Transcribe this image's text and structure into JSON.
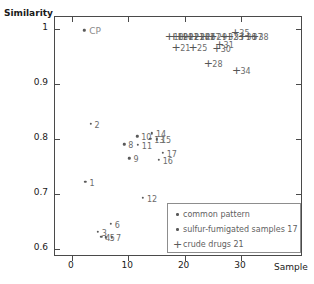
{
  "chart_data": {
    "type": "scatter",
    "title": "",
    "xlabel": "Sample",
    "ylabel": "Similarity",
    "xlim": [
      -3,
      41
    ],
    "ylim": [
      0.585,
      1.022
    ],
    "xticks": [
      "0",
      "10",
      "20",
      "30"
    ],
    "xtick_values": [
      0,
      10,
      20,
      30
    ],
    "yticks": [
      "0.6",
      "0.7",
      "0.8",
      "0.9",
      "1"
    ],
    "ytick_values": [
      0.6,
      0.7,
      0.8,
      0.9,
      1.0
    ],
    "grid": false,
    "legend_position": "bottom-right",
    "series": [
      {
        "name": "common pattern",
        "marker": "dot",
        "color": "#5a5a5a",
        "points": [
          {
            "label": "CP",
            "x": 2.2,
            "y": 0.998
          }
        ]
      },
      {
        "name": "sulfur-fumigated samples 1-17",
        "marker": "dot",
        "color": "#5a5a5a",
        "points": [
          {
            "label": "1",
            "x": 2.4,
            "y": 0.722
          },
          {
            "label": "2",
            "x": 3.3,
            "y": 0.828
          },
          {
            "label": "3",
            "x": 4.6,
            "y": 0.631
          },
          {
            "label": "4",
            "x": 5.2,
            "y": 0.622
          },
          {
            "label": "5",
            "x": 6.0,
            "y": 0.621
          },
          {
            "label": "6",
            "x": 6.9,
            "y": 0.645
          },
          {
            "label": "7",
            "x": 7.1,
            "y": 0.621
          },
          {
            "label": "8",
            "x": 9.3,
            "y": 0.79
          },
          {
            "label": "9",
            "x": 10.2,
            "y": 0.765
          },
          {
            "label": "10",
            "x": 11.6,
            "y": 0.805
          },
          {
            "label": "11",
            "x": 11.7,
            "y": 0.789
          },
          {
            "label": "12",
            "x": 12.6,
            "y": 0.693
          },
          {
            "label": "13",
            "x": 13.9,
            "y": 0.8
          },
          {
            "label": "14",
            "x": 14.2,
            "y": 0.81
          },
          {
            "label": "15",
            "x": 15.1,
            "y": 0.799
          },
          {
            "label": "16",
            "x": 15.4,
            "y": 0.762
          },
          {
            "label": "17",
            "x": 16.1,
            "y": 0.775
          }
        ]
      },
      {
        "name": "crude drugs 18-21",
        "marker": "plus",
        "color": "#555555",
        "points": [
          {
            "label": "18",
            "x": 17.3,
            "y": 0.988
          },
          {
            "label": "19",
            "x": 18.1,
            "y": 0.988
          },
          {
            "label": "20",
            "x": 19.0,
            "y": 0.988
          },
          {
            "label": "21",
            "x": 18.5,
            "y": 0.968
          },
          {
            "label": "22",
            "x": 20.0,
            "y": 0.988
          },
          {
            "label": "23",
            "x": 21.0,
            "y": 0.988
          },
          {
            "label": "24",
            "x": 22.0,
            "y": 0.988
          },
          {
            "label": "25",
            "x": 21.5,
            "y": 0.968
          },
          {
            "label": "26",
            "x": 23.0,
            "y": 0.988
          },
          {
            "label": "27",
            "x": 23.8,
            "y": 0.988
          },
          {
            "label": "28",
            "x": 24.2,
            "y": 0.938
          },
          {
            "label": "29",
            "x": 25.0,
            "y": 0.988
          },
          {
            "label": "30",
            "x": 25.7,
            "y": 0.965
          },
          {
            "label": "31",
            "x": 26.2,
            "y": 0.972
          },
          {
            "label": "32",
            "x": 27.0,
            "y": 0.988
          },
          {
            "label": "33",
            "x": 28.0,
            "y": 0.988
          },
          {
            "label": "34",
            "x": 29.2,
            "y": 0.926
          },
          {
            "label": "35",
            "x": 29.0,
            "y": 0.995
          },
          {
            "label": "36",
            "x": 30.2,
            "y": 0.988
          },
          {
            "label": "37",
            "x": 31.3,
            "y": 0.988
          },
          {
            "label": "38",
            "x": 32.4,
            "y": 0.987
          }
        ]
      }
    ]
  },
  "axes": {
    "y_title": "Similarity",
    "x_title": "Sample"
  },
  "legend": {
    "entries": [
      {
        "marker": "dot",
        "label": "common pattern"
      },
      {
        "marker": "dot",
        "label": "sulfur-fumigated samples 17"
      },
      {
        "marker": "plus",
        "label": "crude drugs  21"
      }
    ]
  }
}
